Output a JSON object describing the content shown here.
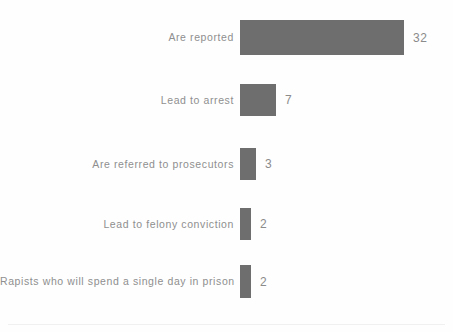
{
  "chart_data": {
    "type": "bar",
    "orientation": "horizontal",
    "title": "",
    "subtitle": "",
    "xlabel": "",
    "ylabel": "",
    "categories": [
      "Are reported",
      "Lead to arrest",
      "Are referred to prosecutors",
      "Lead to felony conviction",
      "Rapists who will spend a single day in prison"
    ],
    "values": [
      32,
      7,
      3,
      2,
      2
    ],
    "value_labels": [
      "32",
      "7",
      "3",
      "2",
      "2"
    ],
    "xlim": [
      0,
      32
    ],
    "grid": false,
    "legend": false,
    "bar_color": "#6e6e6e",
    "label_color": "#8f8f8f",
    "value_color": "#8b8b8b",
    "background_color": "#fefefe"
  },
  "layout": {
    "bars": [
      {
        "top": 20,
        "height": 35,
        "width": 164
      },
      {
        "top": 84,
        "height": 32,
        "width": 36
      },
      {
        "top": 148,
        "height": 32,
        "width": 16
      },
      {
        "top": 208,
        "height": 32,
        "width": 11
      },
      {
        "top": 265,
        "height": 33,
        "width": 11
      }
    ],
    "baseline_rule_top": 324
  }
}
